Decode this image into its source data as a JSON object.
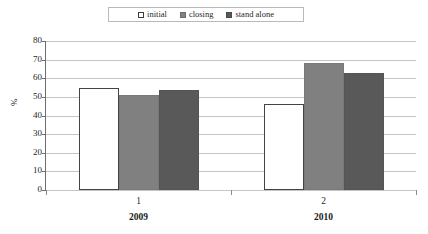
{
  "chart_data": {
    "type": "bar",
    "title": "",
    "subtitle": "",
    "xlabel": "",
    "ylabel": "%",
    "ylim": [
      0,
      80
    ],
    "ytick_step": 10,
    "yticks": [
      80,
      70,
      60,
      50,
      40,
      30,
      20,
      10,
      0
    ],
    "categories": [
      "1",
      "2"
    ],
    "group_labels": [
      "2009",
      "2010"
    ],
    "grid": true,
    "grid_axis": "y",
    "legend_position": "top-center",
    "series": [
      {
        "name": "initial",
        "values": [
          55,
          46
        ],
        "color": "#ffffff",
        "border_color": "#444444"
      },
      {
        "name": "closing",
        "values": [
          51,
          68
        ],
        "color": "#808080",
        "border_color": "#7a7a7a"
      },
      {
        "name": "stand alone",
        "values": [
          53.5,
          63
        ],
        "color": "#595959",
        "border_color": "#545454"
      }
    ]
  },
  "legend": {
    "entries": [
      {
        "label": "initial",
        "swatch": "legend-swatch-initial"
      },
      {
        "label": "closing",
        "swatch": "legend-swatch-closing"
      },
      {
        "label": "stand alone",
        "swatch": "legend-swatch-stand-alone"
      }
    ]
  },
  "axes": {
    "y_title": "%",
    "y_labels": [
      "80",
      "70",
      "60",
      "50",
      "40",
      "30",
      "20",
      "10",
      "0"
    ],
    "x_category_labels": [
      "1",
      "2"
    ],
    "x_group_labels": [
      "2009",
      "2010"
    ]
  },
  "colors": {
    "gridline": "#c4c4c4",
    "axis": "#6e6e6e",
    "text": "#1f1f1f",
    "series_initial": "#ffffff",
    "series_closing": "#808080",
    "series_stand_alone": "#595959"
  }
}
